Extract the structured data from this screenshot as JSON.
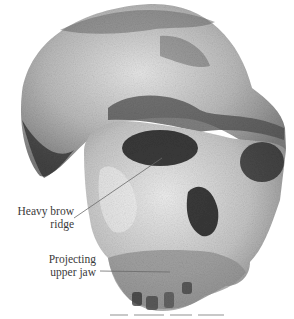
{
  "figure": {
    "style": "grayscale photograph on white background",
    "labels": [
      {
        "id": "brow",
        "line1": "Heavy brow",
        "line2": "ridge"
      },
      {
        "id": "jaw",
        "line1": "Projecting",
        "line2": "upper jaw"
      }
    ],
    "colors": {
      "background": "#ffffff",
      "label_text": "#3a3a3a",
      "leader_line": "#6a6a6a"
    }
  }
}
